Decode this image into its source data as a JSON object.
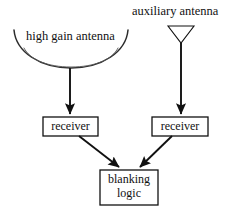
{
  "diagram": {
    "background_color": "#ffffff",
    "line_color": "#111111",
    "text_color": "#111111",
    "labels": {
      "high_gain_antenna": "high gain antenna",
      "auxiliary_antenna": "auxiliary antenna"
    },
    "nodes": [
      {
        "id": "receiver-left",
        "label": "receiver",
        "shape": "rectangle",
        "x": 43,
        "y": 117,
        "width": 55,
        "height": 19
      },
      {
        "id": "receiver-right",
        "label": "receiver",
        "shape": "rectangle",
        "x": 152,
        "y": 117,
        "width": 56,
        "height": 19
      },
      {
        "id": "blanking-logic",
        "label_line1": "blanking",
        "label_line2": "logic",
        "shape": "rectangle",
        "x": 100,
        "y": 170,
        "width": 58,
        "height": 35
      }
    ],
    "antennas": [
      {
        "id": "high-gain-antenna",
        "type": "parabolic-dish",
        "label": "high gain antenna",
        "feed_x": 70
      },
      {
        "id": "auxiliary-antenna",
        "type": "triangle-horn",
        "label": "auxiliary antenna",
        "feed_x": 181
      }
    ],
    "edges": [
      {
        "id": "edge-dish-to-receiver-left",
        "from": "high-gain-antenna",
        "to": "receiver-left",
        "style": "arrow"
      },
      {
        "id": "edge-aux-to-receiver-right",
        "from": "auxiliary-antenna",
        "to": "receiver-right",
        "style": "arrow"
      },
      {
        "id": "edge-receiver-left-to-blanking",
        "from": "receiver-left",
        "to": "blanking-logic",
        "style": "arrow"
      },
      {
        "id": "edge-receiver-right-to-blanking",
        "from": "receiver-right",
        "to": "blanking-logic",
        "style": "arrow"
      }
    ]
  }
}
